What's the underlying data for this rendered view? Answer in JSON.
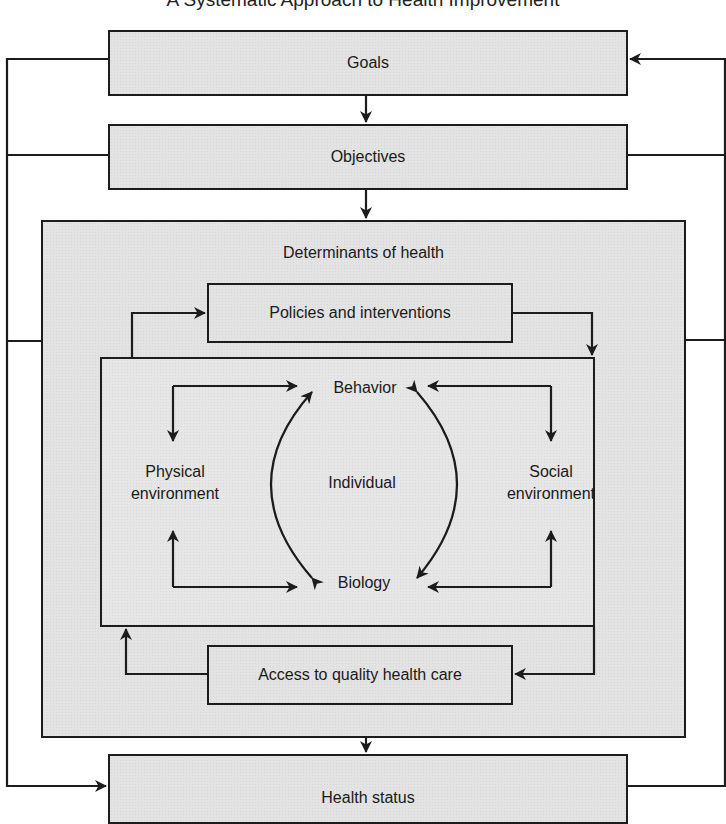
{
  "title": "A Systematic Approach to Health Improvement",
  "boxes": {
    "goals": "Goals",
    "objectives": "Objectives",
    "determinants": "Determinants of health",
    "policies": "Policies and interventions",
    "access": "Access to quality health care",
    "health_status": "Health status"
  },
  "inner": {
    "behavior": "Behavior",
    "individual": "Individual",
    "biology": "Biology",
    "physical_line1": "Physical",
    "physical_line2": "environment",
    "social_line1": "Social",
    "social_line2": "environment"
  },
  "colors": {
    "box_fill": "#e3e3e3",
    "stroke": "#1c1c1c",
    "background": "#ffffff"
  }
}
